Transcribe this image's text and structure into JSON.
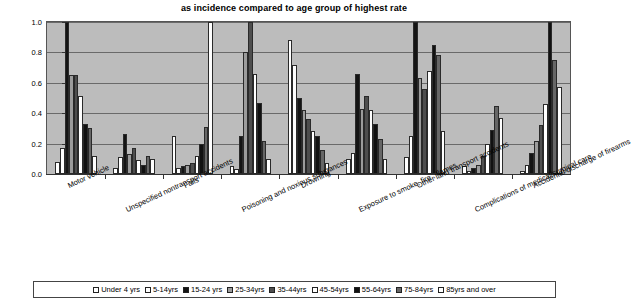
{
  "chart_data": {
    "type": "bar",
    "title": "as incidence compared to age group of highest rate",
    "xlabel": "",
    "ylabel": "",
    "ylim": [
      0.0,
      1.0
    ],
    "ytick_labels": [
      "1.0",
      "0.8",
      "0.6",
      "0.4",
      "0.2",
      "0.0"
    ],
    "ytick_values": [
      1.0,
      0.8,
      0.6,
      0.4,
      0.2,
      0.0
    ],
    "grid": true,
    "legend_position": "bottom",
    "categories": [
      "Motor vehicle",
      "Unspecified nontransport accidents",
      "Falls",
      "Poisoning and noxious substances",
      "Drowning",
      "Exposure to smoke, fire , flames",
      "Other land transport accidents",
      "Complications of medical/surgical care",
      "Accidental discharge of firearms"
    ],
    "series": [
      {
        "name": "Under 4 yrs",
        "values": [
          0.08,
          0.04,
          0.25,
          0.05,
          0.88,
          0.1,
          0.11,
          0.05,
          0.02
        ]
      },
      {
        "name": "5-14yrs",
        "values": [
          0.17,
          0.11,
          0.04,
          0.03,
          0.72,
          0.14,
          0.25,
          0.02,
          0.06
        ]
      },
      {
        "name": "15-24 yrs",
        "values": [
          1.0,
          0.26,
          0.05,
          0.25,
          0.5,
          0.66,
          1.0,
          0.04,
          0.14
        ]
      },
      {
        "name": "25-34yrs",
        "values": [
          0.65,
          0.13,
          0.06,
          0.8,
          0.42,
          0.43,
          0.63,
          0.06,
          0.22
        ]
      },
      {
        "name": "35-44yrs",
        "values": [
          0.65,
          0.17,
          0.07,
          1.0,
          0.36,
          0.51,
          0.56,
          0.12,
          0.32
        ]
      },
      {
        "name": "45-54yrs",
        "values": [
          0.51,
          0.09,
          0.12,
          0.66,
          0.28,
          0.42,
          0.68,
          0.2,
          0.46
        ]
      },
      {
        "name": "55-64yrs",
        "values": [
          0.33,
          0.06,
          0.2,
          0.47,
          0.25,
          0.33,
          0.85,
          0.29,
          1.0
        ]
      },
      {
        "name": "75-84yrs",
        "values": [
          0.3,
          0.12,
          0.31,
          0.22,
          0.16,
          0.23,
          0.78,
          0.45,
          0.75
        ]
      },
      {
        "name": "85yrs and over",
        "values": [
          0.12,
          0.1,
          1.0,
          0.1,
          0.07,
          0.1,
          0.28,
          0.37,
          0.57
        ]
      }
    ],
    "legend_swatches": [
      {
        "label": "Under 4 yrs",
        "color": "#ffffff"
      },
      {
        "label": "5-14yrs",
        "color": "#fdfdfd"
      },
      {
        "label": "15-24 yrs",
        "color": "#141414"
      },
      {
        "label": "25-34yrs",
        "color": "#9c9c9c"
      },
      {
        "label": "35-44yrs",
        "color": "#4e4e4e"
      },
      {
        "label": "45-54yrs",
        "color": "#ffffff"
      },
      {
        "label": "55-64yrs",
        "color": "#111111"
      },
      {
        "label": "75-84yrs",
        "color": "#666666"
      },
      {
        "label": "85yrs and over",
        "color": "#ffffff"
      }
    ],
    "plot_background": "#bcbcbc",
    "grid_color": "#6a6a6a"
  }
}
